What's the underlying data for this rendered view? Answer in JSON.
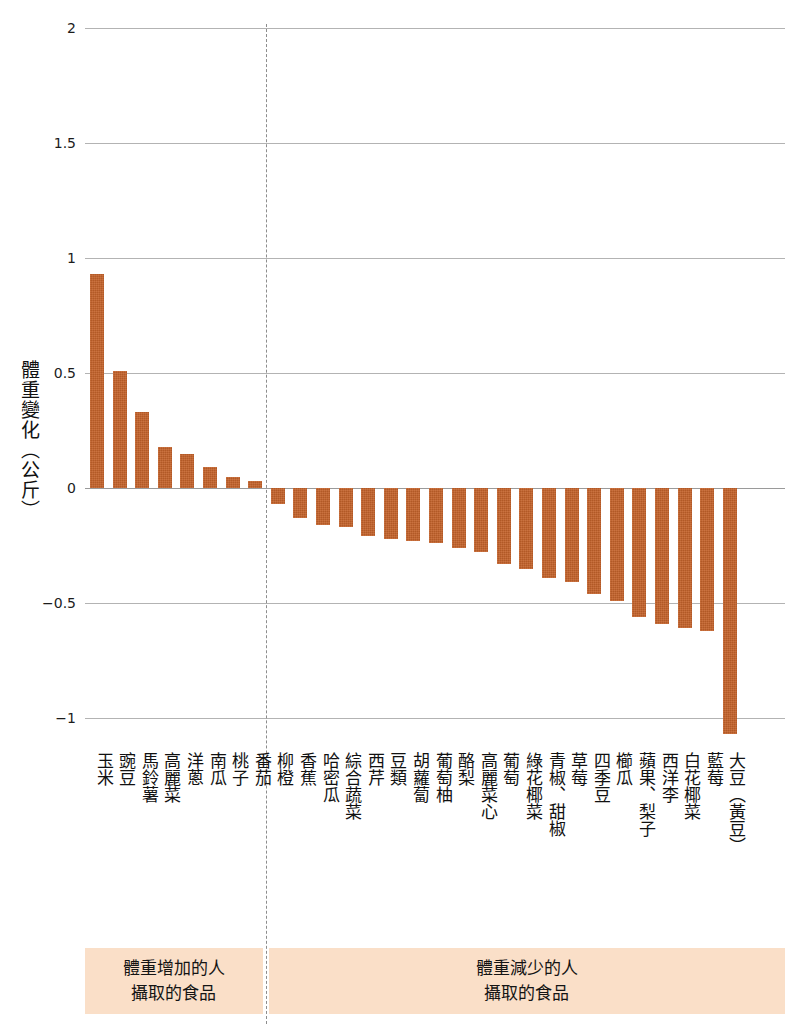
{
  "chart_data": {
    "type": "bar",
    "title": "",
    "xlabel": "",
    "ylabel": "體重變化（公斤）",
    "ylim": [
      -1.2,
      2
    ],
    "yticks": [
      2,
      1.5,
      1,
      0.5,
      0,
      -0.5,
      -1
    ],
    "ytick_labels": [
      "2",
      "1.5",
      "1",
      "0.5",
      "0",
      "−0.5",
      "−1"
    ],
    "grid": true,
    "legend_position": "bottom",
    "bar_color": "#c4622a",
    "band_color": "#fadfc8",
    "categories": [
      "玉米",
      "豌豆",
      "馬鈴薯",
      "高麗菜",
      "洋蔥",
      "南瓜",
      "桃子",
      "番茄",
      "柳橙",
      "香蕉",
      "哈密瓜",
      "綜合蔬菜",
      "西芹",
      "豆類",
      "胡蘿蔔",
      "葡萄柚",
      "酪梨",
      "高麗菜心",
      "葡萄",
      "綠花椰菜",
      "青椒、甜椒",
      "草莓",
      "四季豆",
      "櫛瓜",
      "蘋果、梨子",
      "西洋李",
      "白花椰菜",
      "藍莓",
      "大豆（黃豆）"
    ],
    "values": [
      0.93,
      0.51,
      0.33,
      0.18,
      0.15,
      0.09,
      0.05,
      0.03,
      -0.07,
      -0.13,
      -0.16,
      -0.17,
      -0.21,
      -0.22,
      -0.23,
      -0.24,
      -0.26,
      -0.28,
      -0.33,
      -0.35,
      -0.39,
      -0.41,
      -0.46,
      -0.49,
      -0.56,
      -0.59,
      -0.61,
      -0.62,
      -1.07
    ],
    "annotations": {
      "divider": "分隔線：體重增加 / 體重減少"
    }
  },
  "legend": {
    "left": {
      "line1": "體重增加的人",
      "line2": "攝取的食品"
    },
    "right": {
      "line1": "體重減少的人",
      "line2": "攝取的食品"
    }
  }
}
